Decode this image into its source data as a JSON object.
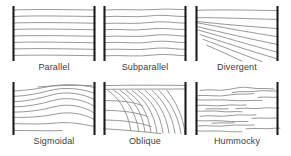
{
  "figure": {
    "width": 291,
    "height": 156,
    "background_color": "#ffffff",
    "reflector_color": "#8c8c8c",
    "boundary_bar_color": "#1d1d1d",
    "label_color": "#3b3b3b"
  },
  "panels": [
    {
      "id": "parallel",
      "label": "Parallel",
      "row": 1,
      "column": 1,
      "description": "Evenly spaced horizontal reflectors of constant spacing spanning both bounding bars",
      "reflector_count": 8,
      "icon": "parallel-reflectors-icon"
    },
    {
      "id": "subparallel",
      "label": "Subparallel",
      "row": 1,
      "column": 2,
      "description": "Nearly parallel reflectors with slight undulation and variable spacing",
      "reflector_count": 8,
      "icon": "subparallel-reflectors-icon"
    },
    {
      "id": "divergent",
      "label": "Divergent",
      "row": 1,
      "column": 3,
      "description": "Reflectors converging toward the left margin and fanning out to the right",
      "reflector_count": 9,
      "icon": "divergent-reflectors-icon"
    },
    {
      "id": "sigmoidal",
      "label": "Sigmoidal",
      "row": 2,
      "column": 1,
      "description": "S-shaped reflectors with gentle upper and lower segments and steeper middle",
      "reflector_count": 8,
      "icon": "sigmoidal-reflectors-icon"
    },
    {
      "id": "oblique",
      "label": "Oblique",
      "row": 2,
      "column": 2,
      "description": "Curved clinoforms descending from a flat top surface toward the lower right",
      "reflector_count": 12,
      "icon": "oblique-reflectors-icon"
    },
    {
      "id": "hummocky",
      "label": "Hummocky",
      "row": 2,
      "column": 3,
      "description": "Short discontinuous irregular wavy reflector segments",
      "reflector_count": 16,
      "icon": "hummocky-reflectors-icon"
    }
  ]
}
